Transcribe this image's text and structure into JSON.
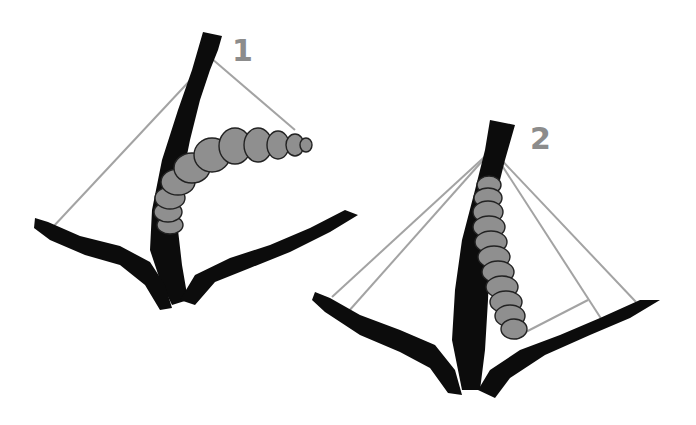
{
  "figure": {
    "panels": [
      {
        "id": "1",
        "label": "1",
        "description": "Caterpillar arched outward from branch fork, silk lines from tip to branch ends"
      },
      {
        "id": "2",
        "label": "2",
        "description": "Caterpillar held against stem by multiple silk lines"
      }
    ],
    "colors": {
      "background": "#ffffff",
      "branch": "#0c0c0c",
      "caterpillar": "#8f8f8f",
      "thread": "#a3a3a3",
      "label": "#8c8c8c"
    }
  }
}
